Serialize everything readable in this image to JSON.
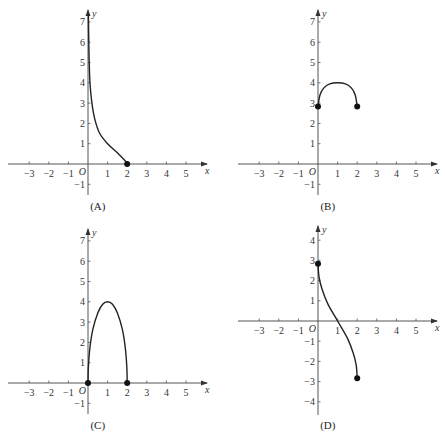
{
  "chart_data": [
    {
      "id": "A",
      "type": "line",
      "caption": "(A)",
      "xlabel": "x",
      "ylabel": "y",
      "origin_label": "O",
      "x_ticks": [
        -3,
        -2,
        -1,
        1,
        2,
        3,
        4,
        5
      ],
      "y_ticks": [
        -1,
        1,
        2,
        3,
        4,
        5,
        6,
        7
      ],
      "xlim": [
        -4,
        5.5
      ],
      "ylim": [
        -1.5,
        7.5
      ],
      "grid": false,
      "points": [
        [
          0.02,
          7.4
        ],
        [
          0.05,
          5.5
        ],
        [
          0.1,
          4.0
        ],
        [
          0.2,
          3.0
        ],
        [
          0.35,
          2.2
        ],
        [
          0.6,
          1.5
        ],
        [
          1.0,
          1.0
        ],
        [
          1.5,
          0.55
        ],
        [
          2.0,
          0.05
        ]
      ],
      "endpoints": [
        [
          2,
          0
        ]
      ]
    },
    {
      "id": "B",
      "type": "line",
      "caption": "(B)",
      "xlabel": "x",
      "ylabel": "y",
      "origin_label": "O",
      "x_ticks": [
        -3,
        -2,
        -1,
        1,
        2,
        3,
        4,
        5
      ],
      "y_ticks": [
        -1,
        1,
        2,
        3,
        4,
        5,
        6,
        7
      ],
      "xlim": [
        -4,
        5.5
      ],
      "ylim": [
        -1.5,
        7.5
      ],
      "grid": false,
      "points": [
        [
          0,
          2.83
        ],
        [
          0.1,
          3.4
        ],
        [
          0.3,
          3.75
        ],
        [
          0.6,
          3.95
        ],
        [
          1,
          4
        ],
        [
          1.4,
          3.95
        ],
        [
          1.7,
          3.75
        ],
        [
          1.9,
          3.4
        ],
        [
          2,
          2.83
        ]
      ],
      "endpoints": [
        [
          0,
          2.83
        ],
        [
          2,
          2.83
        ]
      ]
    },
    {
      "id": "C",
      "type": "line",
      "caption": "(C)",
      "xlabel": "x",
      "ylabel": "y",
      "origin_label": "O",
      "x_ticks": [
        -3,
        -2,
        -1,
        1,
        2,
        3,
        4,
        5
      ],
      "y_ticks": [
        -1,
        1,
        2,
        3,
        4,
        5,
        6,
        7
      ],
      "xlim": [
        -4,
        5.5
      ],
      "ylim": [
        -1.5,
        7.5
      ],
      "grid": false,
      "points": [
        [
          0,
          0
        ],
        [
          0.02,
          0.8
        ],
        [
          0.1,
          1.75
        ],
        [
          0.25,
          2.65
        ],
        [
          0.5,
          3.45
        ],
        [
          0.75,
          3.88
        ],
        [
          1,
          4
        ],
        [
          1.25,
          3.88
        ],
        [
          1.5,
          3.45
        ],
        [
          1.75,
          2.65
        ],
        [
          1.9,
          1.75
        ],
        [
          1.98,
          0.8
        ],
        [
          2,
          0
        ]
      ],
      "endpoints": [
        [
          0,
          0
        ],
        [
          2,
          0
        ]
      ]
    },
    {
      "id": "D",
      "type": "line",
      "caption": "(D)",
      "xlabel": "x",
      "ylabel": "y",
      "origin_label": "O",
      "x_ticks": [
        -3,
        -2,
        -1,
        1,
        2,
        3,
        4,
        5
      ],
      "y_ticks": [
        -4,
        -3,
        -2,
        -1,
        1,
        2,
        3,
        4
      ],
      "xlim": [
        -4,
        5.5
      ],
      "ylim": [
        -4.5,
        4.5
      ],
      "grid": false,
      "points": [
        [
          0,
          2.83
        ],
        [
          0.05,
          2.2
        ],
        [
          0.2,
          1.6
        ],
        [
          0.5,
          0.85
        ],
        [
          1,
          0
        ],
        [
          1.5,
          -0.85
        ],
        [
          1.8,
          -1.6
        ],
        [
          1.95,
          -2.2
        ],
        [
          2,
          -2.83
        ]
      ],
      "endpoints": [
        [
          0,
          2.83
        ],
        [
          2,
          -2.83
        ]
      ]
    }
  ]
}
